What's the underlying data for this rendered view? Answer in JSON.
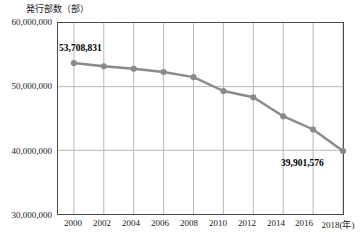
{
  "chart_data": {
    "type": "line",
    "title": "",
    "ylabel": "発行部数（部）",
    "xlabel": "（年）",
    "ylim": [
      30000000,
      60000000
    ],
    "ytick_labels": [
      "60,000,000",
      "50,000,000",
      "40,000,000",
      "30,000,000"
    ],
    "ytick_values": [
      60000000,
      50000000,
      40000000,
      30000000
    ],
    "xlim": [
      2000,
      2018
    ],
    "xtick_labels": [
      "2000",
      "2002",
      "2004",
      "2006",
      "2008",
      "2010",
      "2012",
      "2014",
      "2016",
      "2018(年)"
    ],
    "xtick_values": [
      2000,
      2002,
      2004,
      2006,
      2008,
      2010,
      2012,
      2014,
      2016,
      2018
    ],
    "grid": true,
    "legend": "none",
    "x": [
      2000,
      2002,
      2004,
      2006,
      2008,
      2010,
      2012,
      2014,
      2016,
      2018
    ],
    "values": [
      53708831,
      53198444,
      52817399,
      52310478,
      51491409,
      49321840,
      48344648,
      45362672,
      43276147,
      39901576
    ],
    "annotations": [
      {
        "label": "53,708,831",
        "x": 2000,
        "y": 53708831
      },
      {
        "label": "39,901,576",
        "x": 2018,
        "y": 39901576
      }
    ],
    "series_color": "#8a8a8a",
    "marker_color": "#8a8a8a",
    "grid_color": "#b8b8b8",
    "axis_color": "#4a4a4a"
  }
}
